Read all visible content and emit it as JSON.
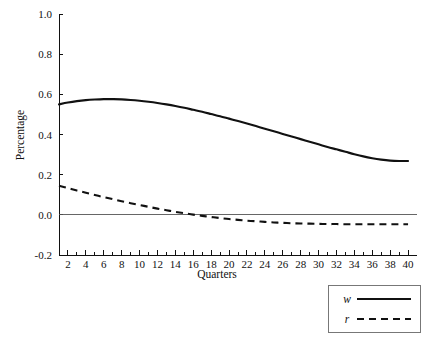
{
  "chart_data": {
    "type": "line",
    "title": "",
    "xlabel": "Quarters",
    "ylabel": "Percentage",
    "xlim": [
      1,
      41
    ],
    "ylim": [
      -0.2,
      1.0
    ],
    "grid": false,
    "legend_position": "bottom-right",
    "ytick_labels": [
      "1.0",
      "0.8",
      "0.6",
      "0.4",
      "0.2",
      "0.0",
      "-0.2"
    ],
    "ytick_values": [
      1.0,
      0.8,
      0.6,
      0.4,
      0.2,
      0.0,
      -0.2
    ],
    "xtick_labels": [
      "2",
      "4",
      "6",
      "8",
      "10",
      "12",
      "14",
      "16",
      "18",
      "20",
      "22",
      "24",
      "26",
      "28",
      "30",
      "32",
      "34",
      "36",
      "38",
      "40"
    ],
    "xtick_values": [
      2,
      4,
      6,
      8,
      10,
      12,
      14,
      16,
      18,
      20,
      22,
      24,
      26,
      28,
      30,
      32,
      34,
      36,
      38,
      40
    ],
    "xminor_values": [
      1,
      3,
      5,
      7,
      9,
      11,
      13,
      15,
      17,
      19,
      21,
      23,
      25,
      27,
      29,
      31,
      33,
      35,
      37,
      39
    ],
    "zero_line": 0.0,
    "x": [
      1,
      2,
      3,
      4,
      5,
      6,
      7,
      8,
      9,
      10,
      11,
      12,
      13,
      14,
      15,
      16,
      17,
      18,
      19,
      20,
      21,
      22,
      23,
      24,
      25,
      26,
      27,
      28,
      29,
      30,
      31,
      32,
      33,
      34,
      35,
      36,
      37,
      38,
      39,
      40
    ],
    "series": [
      {
        "name": "w",
        "style": "solid",
        "color": "#111111",
        "values": [
          0.55,
          0.559,
          0.566,
          0.571,
          0.574,
          0.576,
          0.576,
          0.575,
          0.572,
          0.568,
          0.563,
          0.557,
          0.55,
          0.542,
          0.533,
          0.523,
          0.513,
          0.502,
          0.491,
          0.479,
          0.467,
          0.455,
          0.442,
          0.429,
          0.416,
          0.403,
          0.39,
          0.377,
          0.364,
          0.351,
          0.338,
          0.326,
          0.314,
          0.302,
          0.291,
          0.282,
          0.275,
          0.27,
          0.268,
          0.268
        ]
      },
      {
        "name": "r",
        "style": "dashed",
        "color": "#111111",
        "values": [
          0.145,
          0.133,
          0.121,
          0.11,
          0.099,
          0.088,
          0.078,
          0.068,
          0.058,
          0.049,
          0.04,
          0.031,
          0.023,
          0.015,
          0.008,
          0.001,
          -0.005,
          -0.011,
          -0.016,
          -0.021,
          -0.025,
          -0.029,
          -0.032,
          -0.035,
          -0.038,
          -0.04,
          -0.042,
          -0.043,
          -0.044,
          -0.045,
          -0.046,
          -0.046,
          -0.047,
          -0.047,
          -0.047,
          -0.047,
          -0.047,
          -0.047,
          -0.047,
          -0.047
        ]
      }
    ],
    "legend": [
      {
        "label": "w",
        "style": "solid"
      },
      {
        "label": "r",
        "style": "dashed"
      }
    ]
  }
}
